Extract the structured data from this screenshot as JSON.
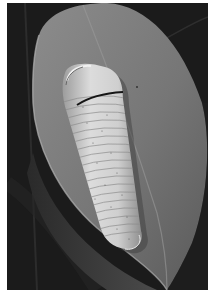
{
  "photo": {
    "subject": "caterpillar on leaf",
    "style": "grayscale photograph",
    "colors": {
      "background": "#1a1a1a",
      "background_vein": "#2e2e2e",
      "leaf_light": "#8a8a8a",
      "leaf_mid": "#6e6e6e",
      "leaf_dark": "#3c3c3c",
      "caterpillar_light": "#d6d6d6",
      "caterpillar_shade": "#a8a8a8",
      "caterpillar_band": "#1c1c1c",
      "border": "#ffffff"
    }
  }
}
